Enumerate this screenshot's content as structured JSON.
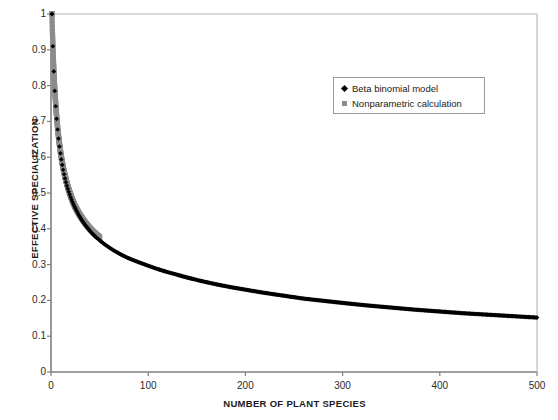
{
  "chart_data": {
    "type": "scatter",
    "title": "",
    "xlabel": "NUMBER OF PLANT SPECIES",
    "ylabel": "EFFECTIVE SPECIALIZATION",
    "xlim": [
      0,
      500
    ],
    "ylim": [
      0,
      1
    ],
    "xticks": [
      0,
      100,
      200,
      300,
      400,
      500
    ],
    "yticks": [
      0,
      0.1,
      0.2,
      0.3,
      0.4,
      0.5,
      0.6,
      0.7,
      0.8,
      0.9,
      1
    ],
    "xtick_labels": [
      "0",
      "100",
      "200",
      "300",
      "400",
      "500"
    ],
    "ytick_labels": [
      "0",
      "0.1",
      "0.2",
      "0.3",
      "0.4",
      "0.5",
      "0.6",
      "0.7",
      "0.8",
      "0.9",
      "1"
    ],
    "grid": false,
    "legend_position": "upper-right-inset",
    "colors": {
      "beta_binomial": "#000000",
      "nonparametric": "#8c8c8c",
      "axis": "#808080",
      "text": "#1a1a1a"
    },
    "series": [
      {
        "name": "Beta binomial model",
        "marker": "diamond",
        "color": "#000000",
        "x": [
          1,
          2,
          3,
          4,
          5,
          6,
          7,
          8,
          9,
          10,
          12,
          14,
          16,
          18,
          20,
          23,
          26,
          30,
          34,
          38,
          42,
          46,
          50,
          56,
          62,
          70,
          78,
          86,
          95,
          105,
          115,
          128,
          140,
          155,
          170,
          185,
          200,
          220,
          240,
          260,
          280,
          300,
          325,
          350,
          375,
          400,
          425,
          450,
          475,
          500
        ],
        "values": [
          1.0,
          0.905,
          0.833,
          0.778,
          0.735,
          0.7,
          0.67,
          0.645,
          0.623,
          0.604,
          0.572,
          0.546,
          0.524,
          0.506,
          0.49,
          0.469,
          0.452,
          0.432,
          0.415,
          0.401,
          0.388,
          0.377,
          0.368,
          0.355,
          0.344,
          0.331,
          0.32,
          0.311,
          0.302,
          0.292,
          0.283,
          0.273,
          0.264,
          0.254,
          0.245,
          0.237,
          0.23,
          0.221,
          0.213,
          0.205,
          0.199,
          0.193,
          0.186,
          0.18,
          0.174,
          0.169,
          0.164,
          0.16,
          0.156,
          0.152
        ]
      },
      {
        "name": "Nonparametric calculation",
        "marker": "square",
        "color": "#8c8c8c",
        "x": [
          1,
          2,
          3,
          4,
          5,
          6,
          7,
          8,
          9,
          10,
          11,
          12,
          13,
          14,
          15,
          16,
          17,
          18,
          19,
          20,
          22,
          24,
          26,
          28,
          30,
          32,
          34,
          36,
          38,
          40,
          42,
          44,
          46,
          48,
          50
        ],
        "values": [
          1.0,
          0.91,
          0.84,
          0.785,
          0.742,
          0.707,
          0.677,
          0.652,
          0.63,
          0.611,
          0.594,
          0.578,
          0.564,
          0.552,
          0.54,
          0.53,
          0.52,
          0.511,
          0.503,
          0.495,
          0.48,
          0.467,
          0.456,
          0.446,
          0.437,
          0.429,
          0.421,
          0.414,
          0.407,
          0.401,
          0.395,
          0.39,
          0.385,
          0.38,
          0.376
        ]
      }
    ],
    "legend": [
      {
        "label": "Beta binomial model",
        "marker": "diamond",
        "color": "#000000"
      },
      {
        "label": "Nonparametric calculation",
        "marker": "square",
        "color": "#8c8c8c"
      }
    ]
  }
}
